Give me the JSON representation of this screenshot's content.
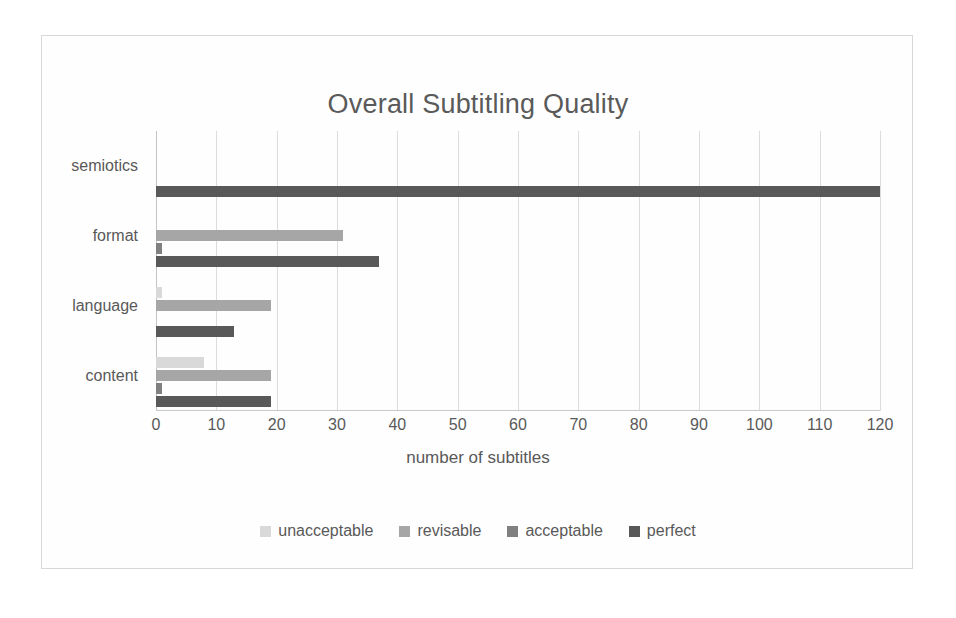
{
  "chart_data": {
    "type": "bar",
    "orientation": "horizontal",
    "title": "Overall Subtitling Quality",
    "xlabel": "number of subtitles",
    "ylabel": "",
    "categories": [
      "semiotics",
      "format",
      "language",
      "content"
    ],
    "series": [
      {
        "name": "unacceptable",
        "color": "#d9d9d9",
        "values": [
          0,
          0,
          1,
          8
        ]
      },
      {
        "name": "revisable",
        "color": "#a6a6a6",
        "values": [
          0,
          31,
          19,
          19
        ]
      },
      {
        "name": "acceptable",
        "color": "#808080",
        "values": [
          0,
          1,
          0,
          1
        ]
      },
      {
        "name": "perfect",
        "color": "#595959",
        "values": [
          120,
          37,
          13,
          19
        ]
      }
    ],
    "xlim": [
      0,
      120
    ],
    "xticks": [
      0,
      10,
      20,
      30,
      40,
      50,
      60,
      70,
      80,
      90,
      100,
      110,
      120
    ],
    "xtick_labels": [
      "0",
      "10",
      "20",
      "30",
      "40",
      "50",
      "60",
      "70",
      "80",
      "90",
      "100",
      "110",
      "120"
    ],
    "grid": "vertical",
    "legend_position": "bottom",
    "legend_entries": [
      "unacceptable",
      "revisable",
      "acceptable",
      "perfect"
    ]
  },
  "style": {
    "frame_color": "#d8d8d8",
    "gridline_color": "#dcdcdc",
    "text_color": "#595959",
    "title_color": "#5a5a5a",
    "background": "#ffffff"
  }
}
